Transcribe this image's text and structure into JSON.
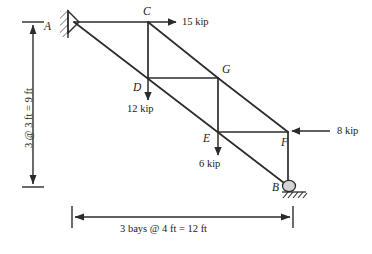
{
  "figure": {
    "stroke_color": "#2b2b2b",
    "text_color": "#1a1a1a",
    "background": "#ffffff"
  },
  "nodes": [
    {
      "id": "A",
      "label": "A",
      "x": 74,
      "y": 22,
      "support": "pin"
    },
    {
      "id": "C",
      "label": "C",
      "x": 148,
      "y": 22,
      "support": "none"
    },
    {
      "id": "D",
      "label": "D",
      "x": 148,
      "y": 78,
      "support": "none"
    },
    {
      "id": "G",
      "label": "G",
      "x": 218,
      "y": 78,
      "support": "none"
    },
    {
      "id": "E",
      "label": "E",
      "x": 218,
      "y": 132,
      "support": "none"
    },
    {
      "id": "F",
      "label": "F",
      "x": 288,
      "y": 132,
      "support": "none"
    },
    {
      "id": "B",
      "label": "B",
      "x": 288,
      "y": 186,
      "support": "roller"
    }
  ],
  "members": [
    {
      "from": "A",
      "to": "C"
    },
    {
      "from": "C",
      "to": "D"
    },
    {
      "from": "A",
      "to": "D"
    },
    {
      "from": "D",
      "to": "G"
    },
    {
      "from": "C",
      "to": "G"
    },
    {
      "from": "G",
      "to": "E"
    },
    {
      "from": "D",
      "to": "E"
    },
    {
      "from": "E",
      "to": "F"
    },
    {
      "from": "G",
      "to": "F"
    },
    {
      "from": "F",
      "to": "B"
    },
    {
      "from": "E",
      "to": "B"
    }
  ],
  "loads": [
    {
      "id": "load-C",
      "label": "15 kip",
      "magnitude": 15,
      "unit": "kip",
      "at": "C",
      "direction": "right"
    },
    {
      "id": "load-D",
      "label": "12 kip",
      "magnitude": 12,
      "unit": "kip",
      "at": "D",
      "direction": "down"
    },
    {
      "id": "load-E",
      "label": "6 kip",
      "magnitude": 6,
      "unit": "kip",
      "at": "E",
      "direction": "down"
    },
    {
      "id": "load-F",
      "label": "8 kip",
      "magnitude": 8,
      "unit": "kip",
      "at": "F",
      "direction": "left"
    }
  ],
  "dimensions": {
    "vertical": {
      "label": "3 @ 3 ft = 9 ft",
      "bays": 3,
      "bay_size": "3 ft",
      "total": "9 ft"
    },
    "horizontal": {
      "label": "3 bays @ 4 ft = 12 ft",
      "bays": 3,
      "bay_size": "4 ft",
      "total": "12 ft"
    }
  },
  "supports": {
    "pin": {
      "at": "A",
      "name": "pin-support"
    },
    "roller": {
      "at": "B",
      "name": "roller-support"
    }
  }
}
